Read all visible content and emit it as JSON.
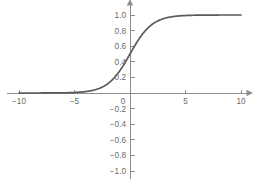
{
  "chart_data": {
    "type": "line",
    "title": "",
    "subtitle": "",
    "xlabel": "",
    "ylabel": "",
    "xlim": [
      -10,
      10
    ],
    "ylim": [
      -1.0,
      1.0
    ],
    "grid": false,
    "legend": null,
    "function": "sigmoid",
    "formula": "1 / (1 + exp(-x))",
    "axis_arrows": {
      "x_right": true,
      "y_top": true
    },
    "colors": {
      "curve": "#5a5a5a",
      "axis": "#8e8e8e",
      "tick_label": "#6b6b6b",
      "background": "#ffffff"
    },
    "xticks": [
      {
        "value": -10,
        "label": "−10"
      },
      {
        "value": -5,
        "label": "−5"
      },
      {
        "value": 0,
        "label": "0"
      },
      {
        "value": 5,
        "label": "5"
      },
      {
        "value": 10,
        "label": "10"
      }
    ],
    "yticks": [
      {
        "value": 1.0,
        "label": "1.0"
      },
      {
        "value": 0.8,
        "label": "0.8"
      },
      {
        "value": 0.6,
        "label": "0.6"
      },
      {
        "value": 0.4,
        "label": "0.4"
      },
      {
        "value": 0.2,
        "label": "0.2"
      },
      {
        "value": -0.2,
        "label": "−0.2"
      },
      {
        "value": -0.4,
        "label": "−0.4"
      },
      {
        "value": -0.6,
        "label": "−0.6"
      },
      {
        "value": -0.8,
        "label": "−0.8"
      },
      {
        "value": -1.0,
        "label": "−1.0"
      }
    ],
    "origin_label": "0",
    "series": [
      {
        "name": "sigmoid",
        "x": [
          -10,
          -9.5,
          -9,
          -8.5,
          -8,
          -7.5,
          -7,
          -6.5,
          -6,
          -5.5,
          -5,
          -4.5,
          -4,
          -3.5,
          -3,
          -2.5,
          -2,
          -1.5,
          -1,
          -0.5,
          0,
          0.5,
          1,
          1.5,
          2,
          2.5,
          3,
          3.5,
          4,
          4.5,
          5,
          5.5,
          6,
          6.5,
          7,
          7.5,
          8,
          8.5,
          9,
          9.5,
          10
        ],
        "values": [
          4.54e-05,
          7.49e-05,
          0.0001234,
          0.0002034,
          0.0003354,
          0.000553,
          0.000911,
          0.0015,
          0.002473,
          0.00407,
          0.006693,
          0.010987,
          0.017986,
          0.029312,
          0.047426,
          0.075858,
          0.119203,
          0.182426,
          0.268941,
          0.377541,
          0.5,
          0.622459,
          0.731059,
          0.817574,
          0.880797,
          0.924142,
          0.952574,
          0.970688,
          0.982014,
          0.989013,
          0.993307,
          0.99593,
          0.997527,
          0.9985,
          0.999089,
          0.999447,
          0.999665,
          0.999797,
          0.999877,
          0.999925,
          0.999955
        ]
      }
    ]
  }
}
